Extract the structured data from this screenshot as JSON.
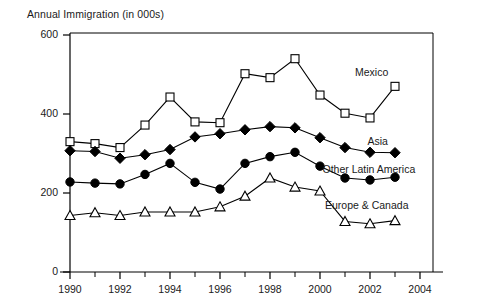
{
  "chart_data": {
    "type": "line",
    "title": "Annual Immigration (in 000s)",
    "xlabel": "",
    "ylabel": "Annual Immigration (in 000s)",
    "x": [
      1990,
      1991,
      1992,
      1993,
      1994,
      1995,
      1996,
      1997,
      1998,
      1999,
      2000,
      2001,
      2002,
      2003
    ],
    "xlim": [
      1989.2,
      2004
    ],
    "ylim": [
      0,
      600
    ],
    "ytick_labels": [
      "0",
      "200",
      "400",
      "600"
    ],
    "yticks": [
      0,
      200,
      400,
      600
    ],
    "xtick_labels": [
      "1990",
      "1992",
      "1994",
      "1996",
      "1998",
      "2000",
      "2002",
      "2004"
    ],
    "xticks": [
      1990,
      1992,
      1994,
      1996,
      1998,
      2000,
      2002,
      2004
    ],
    "xticks_minor": [
      1991,
      1993,
      1995,
      1997,
      1999,
      2001,
      2003
    ],
    "grid": false,
    "legend_position": "inline-right-of-series",
    "series": [
      {
        "name": "Mexico",
        "marker": "open-square",
        "color": "#000000",
        "label_x": 2001.4,
        "label_y": 505,
        "values": [
          330,
          325,
          315,
          372,
          443,
          380,
          378,
          502,
          492,
          540,
          448,
          402,
          390,
          470
        ]
      },
      {
        "name": "Asia",
        "marker": "filled-diamond",
        "color": "#000000",
        "label_x": 2001.9,
        "label_y": 330,
        "values": [
          307,
          305,
          288,
          297,
          310,
          342,
          350,
          360,
          368,
          365,
          340,
          315,
          303,
          302
        ]
      },
      {
        "name": "Other Latin America",
        "marker": "filled-circle",
        "color": "#000000",
        "label_x": 2000.1,
        "label_y": 258,
        "values": [
          228,
          225,
          223,
          247,
          275,
          227,
          210,
          275,
          292,
          303,
          268,
          238,
          233,
          240
        ]
      },
      {
        "name": "Europe & Canada",
        "marker": "open-triangle",
        "color": "#000000",
        "label_x": 2000.2,
        "label_y": 168,
        "values": [
          143,
          150,
          143,
          152,
          152,
          152,
          165,
          192,
          238,
          215,
          205,
          128,
          122,
          130
        ]
      }
    ]
  },
  "axis": {
    "title": "Annual Immigration (in 000s)"
  }
}
